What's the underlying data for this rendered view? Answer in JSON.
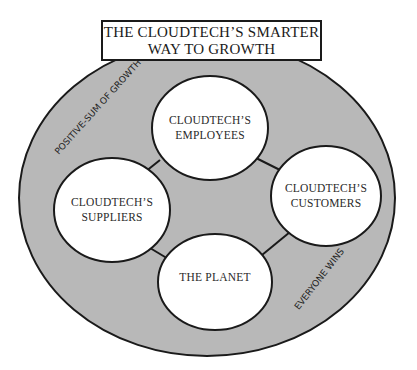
{
  "title": {
    "line1": "THE CLOUDTECH’S SMARTER",
    "line2": "WAY TO GROWTH"
  },
  "ring_labels": {
    "upper_left": "POSITIVE-SUM OF GROWTH",
    "lower_right": "EVERYONE WINS"
  },
  "nodes": {
    "employees": {
      "line1": "CLOUDTECH’S",
      "line2": "EMPLOYEES"
    },
    "suppliers": {
      "line1": "CLOUDTECH’S",
      "line2": "SUPPLIERS"
    },
    "customers": {
      "line1": "CLOUDTECH’S",
      "line2": "CUSTOMERS"
    },
    "planet": {
      "line1": "THE PLANET"
    }
  },
  "colors": {
    "ring_fill": "#b8b8b8",
    "node_fill": "#ffffff",
    "stroke": "#1a1a1a"
  }
}
